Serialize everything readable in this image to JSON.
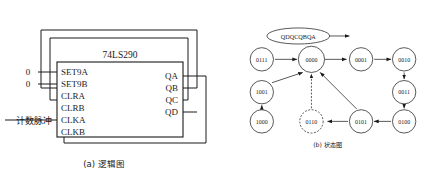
{
  "figure": {
    "panels": [
      {
        "id": "logic",
        "caption": "(a) 逻辑图",
        "chip": {
          "part_number": "74LS290",
          "input_pins": [
            "SET9A",
            "SET9B",
            "CLRA",
            "CLRB",
            "CLKA",
            "CLKB"
          ],
          "output_pins": [
            "QA",
            "QB",
            "QC",
            "QD"
          ]
        },
        "signals": {
          "set9a_level": "0",
          "set9b_level": "0",
          "clock_input_label": "计数脉冲"
        },
        "feedback": [
          {
            "from": "QB",
            "to": "CLRA"
          },
          {
            "from": "QC",
            "to": "CLRB"
          },
          {
            "from": "QA",
            "to": "CLKB"
          }
        ]
      },
      {
        "id": "state",
        "caption": "(b) 状态图",
        "output_order_label": "QDQCQBQA",
        "nodes": [
          {
            "id": "n0111",
            "label": "0111",
            "x": 60,
            "y": 48,
            "style": "solid"
          },
          {
            "id": "n0000",
            "label": "0000",
            "x": 128,
            "y": 48,
            "style": "solid"
          },
          {
            "id": "n0001",
            "label": "0001",
            "x": 196,
            "y": 48,
            "style": "solid"
          },
          {
            "id": "n0010",
            "label": "0010",
            "x": 255,
            "y": 48,
            "style": "solid"
          },
          {
            "id": "n1001",
            "label": "1001",
            "x": 60,
            "y": 93,
            "style": "solid"
          },
          {
            "id": "n0011",
            "label": "0011",
            "x": 255,
            "y": 93,
            "style": "solid"
          },
          {
            "id": "n1000",
            "label": "1000",
            "x": 60,
            "y": 133,
            "style": "solid"
          },
          {
            "id": "n0110",
            "label": "0110",
            "x": 128,
            "y": 133,
            "style": "dashed"
          },
          {
            "id": "n0101",
            "label": "0101",
            "x": 196,
            "y": 133,
            "style": "solid"
          },
          {
            "id": "n0100",
            "label": "0100",
            "x": 255,
            "y": 133,
            "style": "solid"
          }
        ],
        "edges": [
          {
            "from": "0111",
            "to": "0000",
            "style": "solid"
          },
          {
            "from": "0000",
            "to": "0001",
            "style": "solid"
          },
          {
            "from": "0001",
            "to": "0010",
            "style": "solid"
          },
          {
            "from": "0010",
            "to": "0011",
            "style": "solid"
          },
          {
            "from": "0011",
            "to": "0100",
            "style": "solid"
          },
          {
            "from": "0100",
            "to": "0101",
            "style": "solid"
          },
          {
            "from": "0101",
            "to": "0110",
            "style": "solid"
          },
          {
            "from": "0101",
            "to": "0000",
            "style": "solid"
          },
          {
            "from": "0110",
            "to": "0000",
            "style": "dashed"
          },
          {
            "from": "1000",
            "to": "1001",
            "style": "solid"
          },
          {
            "from": "1001",
            "to": "0000",
            "style": "solid"
          }
        ]
      }
    ]
  }
}
